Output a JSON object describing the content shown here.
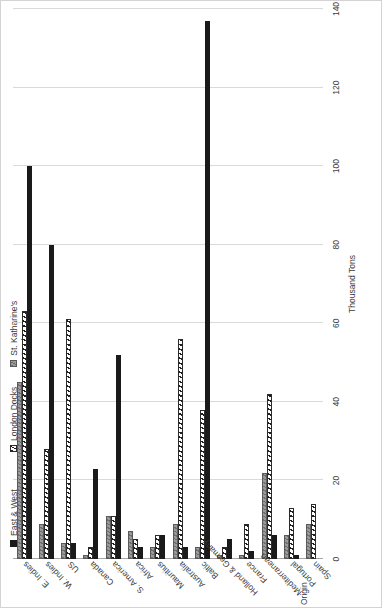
{
  "chart_data": {
    "type": "bar",
    "orientation": "horizontal",
    "title": "",
    "xlabel": "Thousand Tons",
    "ylabel": "Origin",
    "xlim": [
      0,
      140
    ],
    "xticks": [
      0,
      20,
      40,
      60,
      80,
      100,
      120,
      140
    ],
    "xtick_labels": [
      "0",
      "20",
      "40",
      "60",
      "80",
      "100",
      "120",
      "140"
    ],
    "grid": true,
    "legend_position": "top-left",
    "categories": [
      "E. Indies",
      "W. Indies",
      "US",
      "Canada",
      "S. America",
      "Africa",
      "Mauritius",
      "Australia",
      "Baltic",
      "Holland & Germany",
      "France",
      "Mediterranean",
      "Portugal",
      "Spain"
    ],
    "series": [
      {
        "name": "East & West India Docks",
        "color": "#1a1a1a",
        "pattern": "solid",
        "values": [
          100,
          80,
          4,
          23,
          52,
          3,
          6,
          3,
          137,
          5,
          2,
          6,
          1,
          0
        ]
      },
      {
        "name": "London Docks",
        "color": "#ffffff",
        "pattern": "hatched",
        "values": [
          63,
          28,
          61,
          3,
          11,
          5,
          6,
          56,
          38,
          3,
          9,
          42,
          13,
          14
        ]
      },
      {
        "name": "St. Katharine's Docks",
        "color": "#7f7f7f",
        "pattern": "gray",
        "values": [
          45,
          9,
          4,
          1,
          11,
          7,
          3,
          9,
          3,
          1,
          1,
          22,
          6,
          9
        ]
      }
    ]
  },
  "legend": {
    "items": [
      {
        "label": "East & West India Docks"
      },
      {
        "label": "London Docks"
      },
      {
        "label": "St. Katharine's Docks"
      }
    ]
  }
}
